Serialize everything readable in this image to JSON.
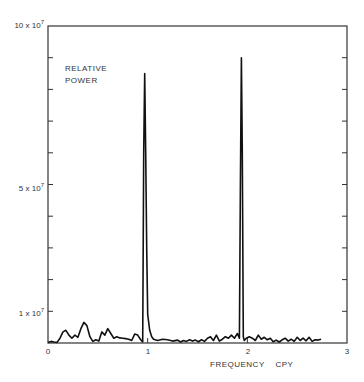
{
  "chart_data": {
    "type": "line",
    "title": "",
    "annotation": "RELATIVE POWER",
    "annotation_lines": [
      "RELATIVE",
      "POWER"
    ],
    "xlabel": "FREQUENCY    CPY",
    "ylabel": "RELATIVE POWER",
    "xlim": [
      0,
      3
    ],
    "ylim": [
      0,
      100000000
    ],
    "x_ticks": [
      "0",
      "1",
      "2",
      "3"
    ],
    "y_tick_labels": [
      {
        "mant": "10 x 10",
        "exp": "7",
        "value": 100000000
      },
      {
        "mant": "5 x 10",
        "exp": "7",
        "value": 50000000
      },
      {
        "mant": "1 x 10",
        "exp": "7",
        "value": 10000000
      }
    ],
    "y_minor_ticks_every": 10000000,
    "grid": false,
    "series": [
      {
        "name": "Relative power spectrum",
        "x": [
          0.0,
          0.03,
          0.06,
          0.09,
          0.12,
          0.15,
          0.18,
          0.21,
          0.24,
          0.27,
          0.3,
          0.33,
          0.36,
          0.39,
          0.42,
          0.45,
          0.48,
          0.51,
          0.54,
          0.57,
          0.6,
          0.63,
          0.66,
          0.69,
          0.72,
          0.75,
          0.78,
          0.81,
          0.84,
          0.87,
          0.9,
          0.93,
          0.95,
          0.96,
          0.97,
          0.98,
          0.99,
          1.0,
          1.02,
          1.04,
          1.06,
          1.1,
          1.15,
          1.2,
          1.25,
          1.3,
          1.33,
          1.36,
          1.39,
          1.42,
          1.45,
          1.48,
          1.51,
          1.54,
          1.57,
          1.6,
          1.63,
          1.66,
          1.69,
          1.72,
          1.75,
          1.78,
          1.81,
          1.84,
          1.87,
          1.9,
          1.92,
          1.93,
          1.94,
          1.95,
          1.96,
          1.97,
          1.99,
          2.02,
          2.05,
          2.08,
          2.11,
          2.14,
          2.17,
          2.2,
          2.23,
          2.26,
          2.29,
          2.32,
          2.35,
          2.38,
          2.41,
          2.44,
          2.47,
          2.5,
          2.53,
          2.56,
          2.59,
          2.62,
          2.65,
          2.68,
          2.71,
          2.74
        ],
        "values": [
          0.2,
          0.5,
          0.3,
          0.2,
          1.5,
          3.5,
          4.0,
          2.5,
          1.5,
          2.5,
          1.8,
          4.5,
          6.5,
          5.5,
          2.0,
          0.5,
          1.0,
          0.6,
          3.5,
          2.5,
          4.5,
          3.0,
          1.5,
          2.0,
          1.6,
          1.5,
          1.4,
          1.2,
          0.8,
          2.8,
          2.5,
          1.0,
          0.3,
          60,
          85,
          60,
          30,
          9,
          4,
          2,
          1.2,
          0.8,
          1.2,
          1.0,
          0.6,
          0.9,
          0.3,
          0.8,
          0.5,
          1.0,
          0.6,
          0.9,
          0.4,
          1.0,
          0.5,
          1.5,
          2.0,
          0.8,
          2.5,
          0.6,
          1.2,
          2.0,
          1.5,
          2.5,
          1.5,
          3.0,
          1.5,
          50,
          90,
          60,
          2,
          0.8,
          1.5,
          2.0,
          1.5,
          0.8,
          2.5,
          1.2,
          1.8,
          1.0,
          1.5,
          0.4,
          0.9,
          0.3,
          1.0,
          1.5,
          0.6,
          1.2,
          0.5,
          1.8,
          0.8,
          1.5,
          0.7,
          1.8,
          0.5,
          1.0,
          0.9,
          1.2
        ],
        "unit": "1e6"
      }
    ],
    "peaks": [
      {
        "x": 0.97,
        "value": 85000000
      },
      {
        "x": 1.94,
        "value": 90000000
      }
    ]
  }
}
